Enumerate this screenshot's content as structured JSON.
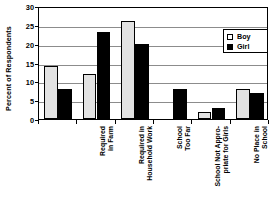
{
  "chart_data": {
    "type": "bar",
    "title": "",
    "xlabel": "",
    "ylabel": "Percent of Respondents",
    "ylim": [
      0,
      30
    ],
    "yticks": [
      0,
      5,
      10,
      15,
      20,
      25,
      30
    ],
    "grid": true,
    "legend_position": "top-right",
    "categories": [
      "Required\nin Farm",
      "Required in\nHousehold Work",
      "School\nToo Far",
      "School Not Appro-\npriate for Girls",
      "No Place in\nSchool",
      "Schooling\nNot Valuable"
    ],
    "series": [
      {
        "name": "Boy",
        "color": "#e2e2e2",
        "values": [
          14,
          12,
          26,
          0,
          2,
          8
        ]
      },
      {
        "name": "Girl",
        "color": "#000000",
        "values": [
          8,
          23,
          20,
          8,
          3,
          7
        ]
      }
    ]
  },
  "legend": {
    "entries": [
      {
        "label": "Boy"
      },
      {
        "label": "Girl"
      }
    ]
  }
}
